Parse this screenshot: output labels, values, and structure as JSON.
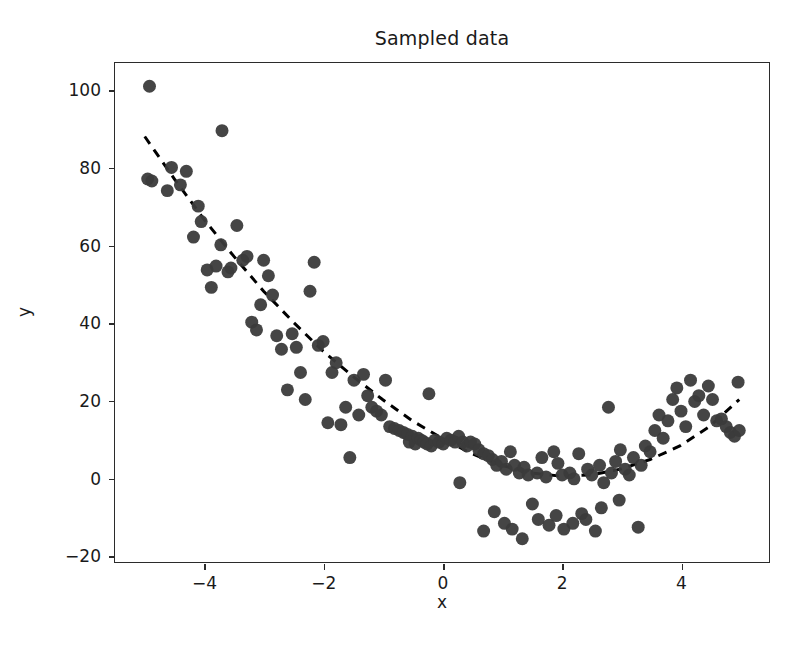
{
  "chart_data": {
    "type": "scatter",
    "title": "Sampled data",
    "xlabel": "x",
    "ylabel": "y",
    "xlim": [
      -5.5,
      5.5
    ],
    "ylim": [
      -22.0,
      107.0
    ],
    "xticks": [
      -4,
      -2,
      0,
      2,
      4
    ],
    "xticklabels": [
      "−4",
      "−2",
      "0",
      "2",
      "4"
    ],
    "yticks": [
      -20,
      0,
      20,
      40,
      60,
      80,
      100
    ],
    "yticklabels": [
      "−20",
      "0",
      "20",
      "40",
      "60",
      "80",
      "100"
    ],
    "grid": false,
    "legend": null,
    "marker": {
      "shape": "circle",
      "color": "#3b3b3b",
      "size_px": 13,
      "alpha": 0.95
    },
    "fit_line": {
      "name": "quadratic fit",
      "style": "dashed",
      "color": "#000000",
      "width_px": 3,
      "dash_px": [
        9,
        7
      ],
      "x": [
        -5.0,
        -4.5,
        -4.0,
        -3.5,
        -3.0,
        -2.5,
        -2.0,
        -1.5,
        -1.0,
        -0.5,
        0.0,
        0.5,
        1.0,
        1.5,
        2.0,
        2.5,
        3.0,
        3.5,
        4.0,
        4.5,
        5.0
      ],
      "y": [
        88.0,
        77.0,
        66.5,
        57.0,
        48.0,
        40.0,
        32.5,
        26.0,
        20.0,
        14.5,
        10.0,
        6.0,
        3.0,
        1.0,
        0.2,
        0.5,
        2.0,
        4.5,
        8.0,
        13.0,
        20.0
      ]
    },
    "series": [
      {
        "name": "samples",
        "n_points": 150,
        "points": [
          [
            -4.92,
            101.0
          ],
          [
            -4.95,
            77.0
          ],
          [
            -4.88,
            76.5
          ],
          [
            -4.55,
            80.0
          ],
          [
            -4.62,
            74.0
          ],
          [
            -4.4,
            75.5
          ],
          [
            -4.3,
            79.0
          ],
          [
            -4.18,
            62.0
          ],
          [
            -4.1,
            70.0
          ],
          [
            -4.05,
            66.0
          ],
          [
            -3.95,
            53.5
          ],
          [
            -3.88,
            49.0
          ],
          [
            -3.8,
            54.5
          ],
          [
            -3.72,
            60.0
          ],
          [
            -3.6,
            53.0
          ],
          [
            -3.55,
            54.0
          ],
          [
            -3.7,
            89.5
          ],
          [
            -3.45,
            65.0
          ],
          [
            -3.35,
            56.0
          ],
          [
            -3.28,
            57.0
          ],
          [
            -3.2,
            40.0
          ],
          [
            -3.12,
            38.0
          ],
          [
            -3.05,
            44.5
          ],
          [
            -3.0,
            56.0
          ],
          [
            -2.92,
            52.0
          ],
          [
            -2.85,
            47.0
          ],
          [
            -2.78,
            36.5
          ],
          [
            -2.7,
            33.0
          ],
          [
            -2.6,
            22.5
          ],
          [
            -2.52,
            37.0
          ],
          [
            -2.45,
            33.5
          ],
          [
            -2.38,
            27.0
          ],
          [
            -2.3,
            20.0
          ],
          [
            -2.22,
            48.0
          ],
          [
            -2.15,
            55.5
          ],
          [
            -2.08,
            34.0
          ],
          [
            -2.0,
            35.0
          ],
          [
            -1.92,
            14.0
          ],
          [
            -1.85,
            27.0
          ],
          [
            -1.78,
            29.5
          ],
          [
            -1.7,
            13.5
          ],
          [
            -1.62,
            18.0
          ],
          [
            -1.55,
            5.0
          ],
          [
            -1.48,
            25.0
          ],
          [
            -1.4,
            16.0
          ],
          [
            -1.32,
            26.5
          ],
          [
            -1.25,
            21.0
          ],
          [
            -1.18,
            18.0
          ],
          [
            -1.1,
            17.0
          ],
          [
            -1.02,
            16.0
          ],
          [
            -0.95,
            25.0
          ],
          [
            -0.88,
            13.0
          ],
          [
            -0.8,
            12.5
          ],
          [
            -0.72,
            12.0
          ],
          [
            -0.65,
            11.5
          ],
          [
            -0.58,
            11.0
          ],
          [
            -0.5,
            10.5
          ],
          [
            -0.55,
            9.0
          ],
          [
            -0.45,
            8.5
          ],
          [
            -0.4,
            10.0
          ],
          [
            -0.35,
            9.5
          ],
          [
            -0.3,
            9.0
          ],
          [
            -0.22,
            21.5
          ],
          [
            -0.25,
            8.5
          ],
          [
            -0.18,
            8.0
          ],
          [
            -0.12,
            9.5
          ],
          [
            -0.05,
            9.0
          ],
          [
            0.02,
            8.5
          ],
          [
            0.08,
            10.0
          ],
          [
            0.15,
            9.5
          ],
          [
            0.22,
            9.0
          ],
          [
            0.28,
            10.5
          ],
          [
            0.35,
            9.0
          ],
          [
            0.3,
            -1.5
          ],
          [
            0.42,
            8.0
          ],
          [
            0.48,
            9.0
          ],
          [
            0.55,
            8.5
          ],
          [
            0.62,
            7.0
          ],
          [
            0.7,
            6.0
          ],
          [
            0.78,
            5.5
          ],
          [
            0.85,
            4.5
          ],
          [
            0.92,
            3.0
          ],
          [
            0.7,
            -14.0
          ],
          [
            0.88,
            -9.0
          ],
          [
            1.0,
            4.0
          ],
          [
            1.08,
            2.0
          ],
          [
            1.15,
            6.5
          ],
          [
            1.22,
            3.0
          ],
          [
            1.05,
            -12.0
          ],
          [
            1.18,
            -13.5
          ],
          [
            1.3,
            1.0
          ],
          [
            1.38,
            2.5
          ],
          [
            1.45,
            0.5
          ],
          [
            1.35,
            -16.0
          ],
          [
            1.52,
            -7.0
          ],
          [
            1.6,
            1.0
          ],
          [
            1.68,
            5.0
          ],
          [
            1.75,
            0.0
          ],
          [
            1.62,
            -11.0
          ],
          [
            1.8,
            -12.5
          ],
          [
            1.88,
            6.5
          ],
          [
            1.95,
            3.5
          ],
          [
            2.02,
            0.5
          ],
          [
            1.92,
            -10.0
          ],
          [
            2.05,
            -13.5
          ],
          [
            2.15,
            1.0
          ],
          [
            2.22,
            -0.5
          ],
          [
            2.3,
            6.0
          ],
          [
            2.2,
            -12.0
          ],
          [
            2.35,
            -9.5
          ],
          [
            2.45,
            2.0
          ],
          [
            2.52,
            0.5
          ],
          [
            2.42,
            -11.0
          ],
          [
            2.58,
            -14.0
          ],
          [
            2.65,
            3.0
          ],
          [
            2.72,
            -1.5
          ],
          [
            2.8,
            18.0
          ],
          [
            2.68,
            -8.0
          ],
          [
            2.85,
            1.0
          ],
          [
            2.92,
            4.0
          ],
          [
            3.0,
            7.0
          ],
          [
            3.08,
            2.0
          ],
          [
            2.98,
            -6.0
          ],
          [
            3.15,
            0.5
          ],
          [
            3.22,
            5.0
          ],
          [
            3.3,
            -13.0
          ],
          [
            3.35,
            3.0
          ],
          [
            3.42,
            8.0
          ],
          [
            3.5,
            6.5
          ],
          [
            3.58,
            12.0
          ],
          [
            3.65,
            16.0
          ],
          [
            3.72,
            10.0
          ],
          [
            3.8,
            14.5
          ],
          [
            3.88,
            20.0
          ],
          [
            3.95,
            23.0
          ],
          [
            4.02,
            17.0
          ],
          [
            4.1,
            13.0
          ],
          [
            4.18,
            25.0
          ],
          [
            4.25,
            19.5
          ],
          [
            4.32,
            21.0
          ],
          [
            4.4,
            16.0
          ],
          [
            4.48,
            23.5
          ],
          [
            4.55,
            20.0
          ],
          [
            4.62,
            14.5
          ],
          [
            4.7,
            15.0
          ],
          [
            4.78,
            13.0
          ],
          [
            4.85,
            11.5
          ],
          [
            4.92,
            10.5
          ],
          [
            4.98,
            24.5
          ],
          [
            5.0,
            12.0
          ]
        ]
      }
    ]
  }
}
